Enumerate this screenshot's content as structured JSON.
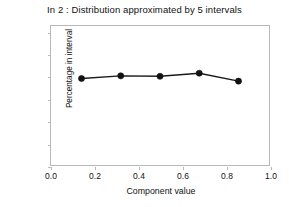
{
  "chart_data": {
    "type": "line",
    "title": "In 2 : Distribution approximated by 5 intervals",
    "xlabel": "Component value",
    "ylabel": "Percentage in interval",
    "x": [
      0.14,
      0.32,
      0.5,
      0.68,
      0.86
    ],
    "values": [
      19.6,
      20.2,
      20.1,
      20.8,
      19.0
    ],
    "series": [
      {
        "name": "Percentage in interval",
        "values": [
          19.6,
          20.2,
          20.1,
          20.8,
          19.0
        ]
      }
    ],
    "xlim": [
      0.0,
      1.0
    ],
    "ylim": [
      0,
      31.5
    ],
    "xticks": [
      0.0,
      0.2,
      0.4,
      0.6,
      0.8,
      1.0
    ],
    "xtick_labels": [
      "0.0",
      "0.2",
      "0.4",
      "0.6",
      "0.8",
      "1.0"
    ],
    "yticks": [
      0,
      5,
      10,
      15,
      20,
      25,
      30
    ],
    "ytick_labels": [
      "0",
      "5",
      "10",
      "15",
      "20",
      "25",
      "30"
    ],
    "grid": false,
    "legend": false,
    "marker": "filled-circle",
    "line_color": "#1a1a1a",
    "marker_color": "#111111",
    "frame_color": "#b9b9b9",
    "background": "#ffffff"
  }
}
